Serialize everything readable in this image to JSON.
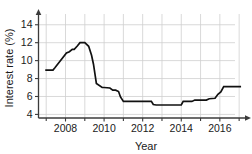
{
  "chart_data": {
    "type": "line",
    "title": "",
    "xlabel": "Year",
    "ylabel": "Interest rate (%)",
    "xlim": [
      2006.6,
      2017.2
    ],
    "ylim": [
      3.6,
      15.2
    ],
    "xticks": [
      2008,
      2010,
      2012,
      2014,
      2016
    ],
    "xtick_labels": [
      "2008",
      "2010",
      "2012",
      "2014",
      "2016"
    ],
    "yticks": [
      4,
      6,
      8,
      10,
      12,
      14
    ],
    "ytick_labels": [
      "4",
      "6",
      "8",
      "10",
      "12",
      "14"
    ],
    "grid": true,
    "legend": "none",
    "line_color": "#111111",
    "grid_color": "#cfcfcf",
    "axis_color": "#3b3b3b",
    "series": [
      {
        "name": "Interest rate",
        "x": [
          2006.95,
          2007.35,
          2007.45,
          2008.05,
          2008.2,
          2008.35,
          2008.45,
          2008.6,
          2008.75,
          2009.0,
          2009.2,
          2009.35,
          2009.45,
          2009.6,
          2009.9,
          2010.0,
          2010.3,
          2010.45,
          2010.6,
          2010.75,
          2010.85,
          2011.0,
          2012.45,
          2012.55,
          2012.7,
          2013.85,
          2014.0,
          2014.1,
          2014.55,
          2014.7,
          2015.3,
          2015.45,
          2015.75,
          2015.9,
          2016.05,
          2016.2,
          2016.35,
          2017.1
        ],
        "y": [
          8.95,
          8.95,
          9.2,
          10.85,
          11.0,
          11.25,
          11.25,
          11.6,
          12.0,
          12.0,
          11.6,
          10.6,
          9.6,
          7.45,
          7.0,
          7.0,
          6.95,
          6.7,
          6.7,
          6.55,
          5.95,
          5.45,
          5.45,
          5.1,
          5.05,
          5.05,
          5.05,
          5.45,
          5.45,
          5.6,
          5.6,
          5.75,
          5.8,
          6.25,
          6.5,
          7.1,
          7.1,
          7.1
        ]
      }
    ]
  },
  "axes": {
    "ylabel_text": "Interest rate (%)",
    "xlabel_text": "Year"
  }
}
